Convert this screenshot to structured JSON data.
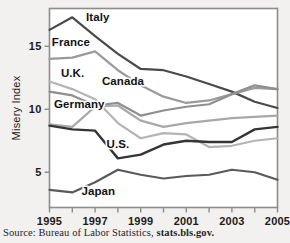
{
  "figure": {
    "background_color": "#f2f1ef",
    "plot_background_color": "#ffffff",
    "frame_color": "#8d8c88"
  },
  "source": {
    "label": "Source: Bureau of Labor Statistics,",
    "url": "stats.bls.gov."
  },
  "chart_data": {
    "type": "line",
    "title": "",
    "subtitle": "",
    "xlabel": "",
    "ylabel": "Misery Index",
    "xlim": [
      1995,
      2005
    ],
    "ylim": [
      2.2,
      18.0
    ],
    "yticks": [
      5,
      10,
      15
    ],
    "ytick_labels": [
      "5",
      "10",
      "15"
    ],
    "xticks": [
      1995,
      1996,
      1997,
      1998,
      1999,
      2000,
      2001,
      2002,
      2003,
      2004,
      2005
    ],
    "xtick_labels": [
      "1995",
      "",
      "1997",
      "",
      "1999",
      "",
      "2001",
      "",
      "2003",
      "",
      "2005"
    ],
    "x": [
      1995,
      1996,
      1997,
      1998,
      1999,
      2000,
      2001,
      2002,
      2003,
      2004,
      2005
    ],
    "grid": false,
    "legend_position": "inline-annotations",
    "series": [
      {
        "name": "Italy",
        "color": "#4a4a4a",
        "width": 2.2,
        "values": [
          16.3,
          17.3,
          15.8,
          14.4,
          13.2,
          13.1,
          12.6,
          12.0,
          11.4,
          10.6,
          10.1
        ],
        "label_x": 1996.6,
        "label_y": 17.0
      },
      {
        "name": "France",
        "color": "#9a9a9a",
        "width": 2.2,
        "values": [
          14.0,
          14.1,
          14.6,
          13.1,
          11.9,
          11.0,
          10.5,
          10.7,
          11.2,
          11.7,
          11.6
        ],
        "label_x": 1995.1,
        "label_y": 15.0
      },
      {
        "name": "U.K.",
        "color": "#b4b4b4",
        "width": 2.2,
        "values": [
          12.2,
          11.6,
          10.8,
          8.9,
          7.7,
          8.1,
          8.0,
          7.0,
          7.1,
          7.5,
          7.7
        ],
        "label_x": 1995.5,
        "label_y": 12.6
      },
      {
        "name": "Canada",
        "color": "#8f8f8f",
        "width": 2.2,
        "values": [
          11.4,
          11.1,
          10.3,
          10.5,
          9.5,
          9.9,
          10.2,
          10.4,
          11.2,
          11.9,
          11.6
        ],
        "label_x": 1997.3,
        "label_y": 11.9
      },
      {
        "name": "Germany",
        "color": "#a8a8a8",
        "width": 2.2,
        "values": [
          8.8,
          8.6,
          10.2,
          10.3,
          9.1,
          8.6,
          8.9,
          9.1,
          9.3,
          9.4,
          9.5
        ],
        "label_x": 1995.2,
        "label_y": 10.1
      },
      {
        "name": "U.S.",
        "color": "#353535",
        "width": 2.4,
        "values": [
          8.7,
          8.4,
          8.3,
          6.1,
          6.4,
          7.2,
          7.5,
          7.4,
          7.4,
          8.4,
          8.6
        ],
        "label_x": 1997.5,
        "label_y": 6.9
      },
      {
        "name": "Japan",
        "color": "#5a5a5a",
        "width": 2.2,
        "values": [
          3.6,
          3.4,
          4.2,
          5.2,
          4.8,
          4.5,
          4.7,
          4.8,
          5.2,
          5.0,
          4.4
        ],
        "label_x": 1996.4,
        "label_y": 3.2
      }
    ]
  }
}
